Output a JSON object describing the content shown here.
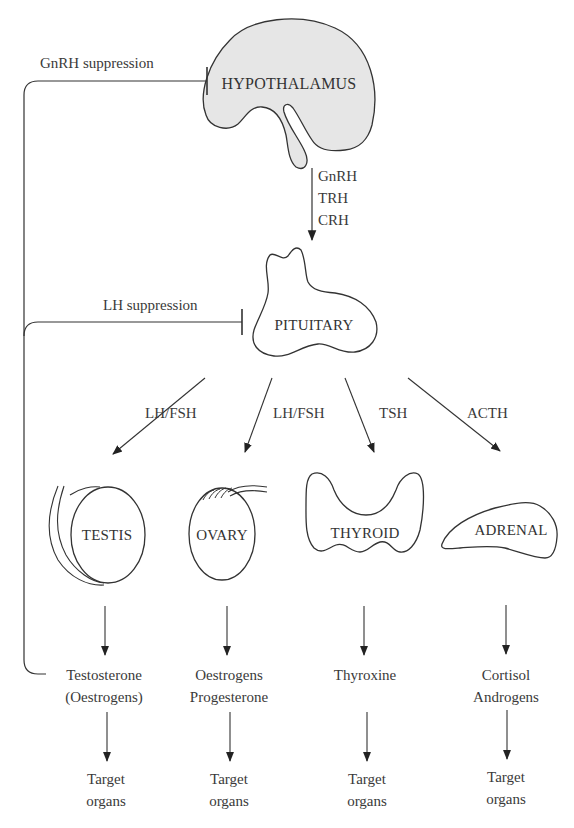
{
  "colors": {
    "stroke": "#333333",
    "hypothalamus_fill": "#e6e6e6",
    "organ_fill": "#ffffff",
    "text": "#3a3a3a",
    "background": "#ffffff"
  },
  "nodes": {
    "hypothalamus": {
      "label": "HYPOTHALAMUS"
    },
    "pituitary": {
      "label": "PITUITARY"
    },
    "testis": {
      "label": "TESTIS"
    },
    "ovary": {
      "label": "OVARY"
    },
    "thyroid": {
      "label": "THYROID"
    },
    "adrenal": {
      "label": "ADRENAL"
    }
  },
  "releasing_hormones": [
    "GnRH",
    "TRH",
    "CRH"
  ],
  "feedback": {
    "gnrh": {
      "label": "GnRH suppression",
      "type": "inhibition"
    },
    "lh": {
      "label": "LH suppression",
      "type": "inhibition"
    }
  },
  "pituitary_outputs": [
    {
      "label": "LH/FSH",
      "target": "testis"
    },
    {
      "label": "LH/FSH",
      "target": "ovary"
    },
    {
      "label": "TSH",
      "target": "thyroid"
    },
    {
      "label": "ACTH",
      "target": "adrenal"
    }
  ],
  "gland_products": [
    {
      "organ": "testis",
      "lines": [
        "Testosterone",
        "(Oestrogens)"
      ]
    },
    {
      "organ": "ovary",
      "lines": [
        "Oestrogens",
        "Progesterone"
      ]
    },
    {
      "organ": "thyroid",
      "lines": [
        "Thyroxine"
      ]
    },
    {
      "organ": "adrenal",
      "lines": [
        "Cortisol",
        "Androgens"
      ]
    }
  ],
  "targets": [
    {
      "lines": [
        "Target",
        "organs"
      ]
    },
    {
      "lines": [
        "Target",
        "organs"
      ]
    },
    {
      "lines": [
        "Target",
        "organs"
      ]
    },
    {
      "lines": [
        "Target",
        "organs"
      ]
    }
  ]
}
